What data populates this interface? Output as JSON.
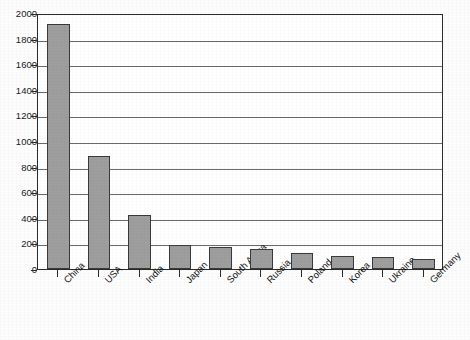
{
  "chart_data": {
    "type": "bar",
    "title": "",
    "xlabel": "",
    "ylabel": "",
    "categories": [
      "China",
      "USA",
      "India",
      "Japan",
      "South Africa",
      "Russia",
      "Poland",
      "Korea",
      "Ukraine",
      "Germany"
    ],
    "values": [
      1915,
      880,
      420,
      190,
      175,
      160,
      125,
      100,
      95,
      80
    ],
    "ylim": [
      0,
      2000
    ],
    "yticks": [
      0,
      200,
      400,
      600,
      800,
      1000,
      1200,
      1400,
      1600,
      1800,
      2000
    ],
    "ytick_labels": [
      "0",
      "200",
      "400",
      "600",
      "800",
      "1000",
      "1200",
      "1400",
      "1600",
      "1800",
      "2000"
    ],
    "grid": true,
    "grid_axis": "y",
    "legend": false,
    "legend_position": "none",
    "bar_color": "#9e9e9e",
    "bar_edge_color": "#3a3a3a",
    "axis_color": "#2b2b2b",
    "grid_color": "#6a6a6a",
    "plot_background": "#ffffff",
    "figure_background": "#fdfdfd",
    "xtick_label_rotation": -45
  }
}
